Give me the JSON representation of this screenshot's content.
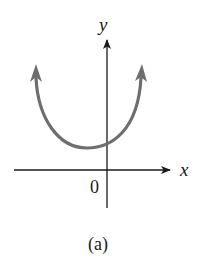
{
  "figure": {
    "axis_x_label": "x",
    "axis_y_label": "y",
    "origin_label": "0",
    "caption": "(a)",
    "curve_color": "#6e6e6e",
    "axis_color": "#1a1a1a"
  }
}
